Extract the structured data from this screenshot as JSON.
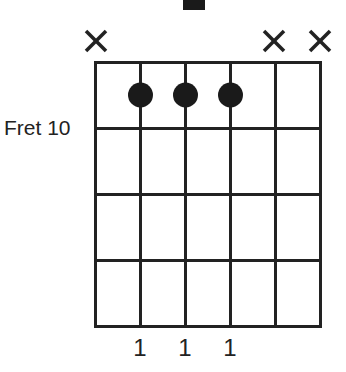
{
  "chord": {
    "title_fragment": "",
    "position_label": "Fret 10",
    "num_strings": 6,
    "num_frets_shown": 4,
    "strings": [
      {
        "index": 1,
        "state": "muted",
        "marker": "×",
        "finger": ""
      },
      {
        "index": 2,
        "state": "fretted",
        "fret": 1,
        "finger": "1"
      },
      {
        "index": 3,
        "state": "fretted",
        "fret": 1,
        "finger": "1"
      },
      {
        "index": 4,
        "state": "fretted",
        "fret": 1,
        "finger": "1"
      },
      {
        "index": 5,
        "state": "muted",
        "marker": "×",
        "finger": ""
      },
      {
        "index": 6,
        "state": "muted",
        "marker": "×",
        "finger": ""
      }
    ],
    "finger_labels": {
      "s2": "1",
      "s3": "1",
      "s4": "1"
    },
    "colors": {
      "line": "#222222",
      "dot": "#1a1a1a",
      "background": "#ffffff"
    }
  }
}
